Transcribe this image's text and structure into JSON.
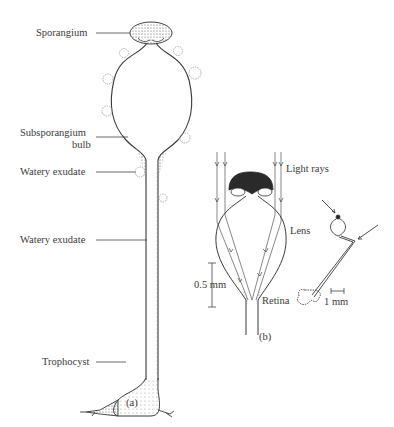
{
  "figure": {
    "panel_a": {
      "caption": "(a)",
      "labels": {
        "sporangium": "Sporangium",
        "subsporangium_line1": "Subsporangium",
        "subsporangium_line2": "bulb",
        "watery_exudate_1": "Watery exudate",
        "watery_exudate_2": "Watery exudate",
        "trophocyst": "Trophocyst"
      }
    },
    "panel_b": {
      "caption": "(b)",
      "labels": {
        "light_rays": "Light rays",
        "lens": "Lens",
        "retina": "Retina",
        "scale_left": "0.5 mm",
        "scale_right": "1 mm"
      }
    },
    "colors": {
      "ink": "#3a3a3a",
      "stipple": "#555555",
      "sporangium_fill": "#2a2a2a",
      "droplet": "#999999"
    }
  }
}
